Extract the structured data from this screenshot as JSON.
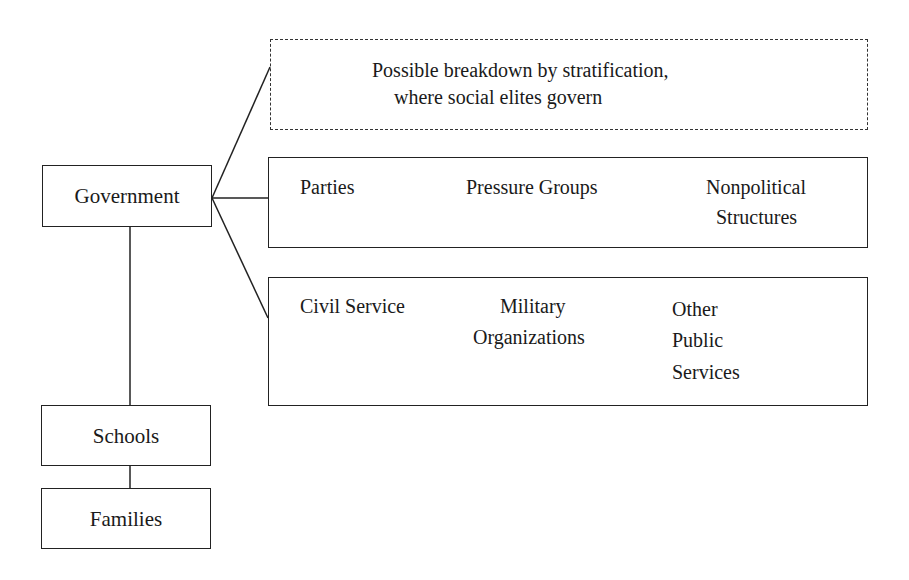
{
  "diagram": {
    "nodes": {
      "government": "Government",
      "schools": "Schools",
      "families": "Families"
    },
    "stratification_box": {
      "line1": "Possible breakdown by stratification,",
      "line2": "where social elites govern",
      "style": "dashed"
    },
    "political_box": {
      "items": [
        "Parties",
        "Pressure Groups",
        "Nonpolitical",
        "Structures"
      ],
      "item_parties": "Parties",
      "item_pressure": "Pressure Groups",
      "item_nonpolitical_1": "Nonpolitical",
      "item_nonpolitical_2": "Structures"
    },
    "public_box": {
      "item_civil": "Civil Service",
      "item_military_1": "Military",
      "item_military_2": "Organizations",
      "item_other_1": "Other",
      "item_other_2": "Public",
      "item_other_3": "Services"
    },
    "colors": {
      "line": "#222222",
      "background": "#ffffff",
      "text": "#1a1a1a"
    }
  }
}
